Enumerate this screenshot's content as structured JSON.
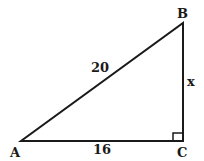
{
  "diagram": {
    "type": "right-triangle",
    "vertices": {
      "A": "A",
      "B": "B",
      "C": "C"
    },
    "sides": {
      "hypotenuse_AB": "20",
      "base_AC": "16",
      "leg_BC": "x"
    },
    "right_angle_at": "C",
    "stroke_color": "#1a1a1a"
  }
}
